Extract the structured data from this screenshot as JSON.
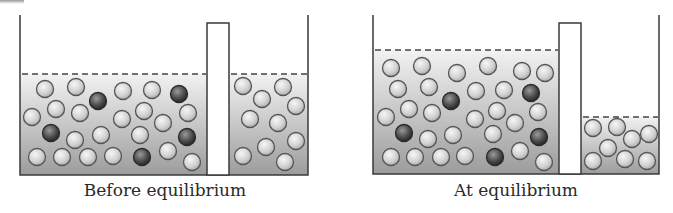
{
  "colors": {
    "outline": "#3a3a3a",
    "fluid_top": "#f2f2f2",
    "fluid_bottom": "#9c9c9c",
    "solvent_ball": "#d6d6d6",
    "solute_ball": "#3c3c3c"
  },
  "panels": [
    {
      "id": "before",
      "caption": "Before equilibrium",
      "caption_x": 165,
      "left_wall_x": 20,
      "right_wall_x": 308,
      "wall_top_y": 15,
      "bottom_y": 175,
      "divider": {
        "x1": 207,
        "x2": 229,
        "top_y": 23
      },
      "left_level_y": 74,
      "right_level_y": 74,
      "balls": [
        {
          "x": 45,
          "y": 89,
          "type": "solvent"
        },
        {
          "x": 76,
          "y": 87,
          "type": "solvent"
        },
        {
          "x": 98,
          "y": 101,
          "type": "solute"
        },
        {
          "x": 123,
          "y": 91,
          "type": "solvent"
        },
        {
          "x": 152,
          "y": 90,
          "type": "solvent"
        },
        {
          "x": 179,
          "y": 94,
          "type": "solute"
        },
        {
          "x": 32,
          "y": 117,
          "type": "solvent"
        },
        {
          "x": 56,
          "y": 109,
          "type": "solvent"
        },
        {
          "x": 80,
          "y": 113,
          "type": "solvent"
        },
        {
          "x": 122,
          "y": 119,
          "type": "solvent"
        },
        {
          "x": 144,
          "y": 111,
          "type": "solvent"
        },
        {
          "x": 163,
          "y": 123,
          "type": "solvent"
        },
        {
          "x": 188,
          "y": 113,
          "type": "solvent"
        },
        {
          "x": 51,
          "y": 133,
          "type": "solute"
        },
        {
          "x": 75,
          "y": 140,
          "type": "solvent"
        },
        {
          "x": 101,
          "y": 135,
          "type": "solvent"
        },
        {
          "x": 140,
          "y": 135,
          "type": "solvent"
        },
        {
          "x": 187,
          "y": 137,
          "type": "solute"
        },
        {
          "x": 37,
          "y": 157,
          "type": "solvent"
        },
        {
          "x": 62,
          "y": 157,
          "type": "solvent"
        },
        {
          "x": 88,
          "y": 157,
          "type": "solvent"
        },
        {
          "x": 113,
          "y": 156,
          "type": "solvent"
        },
        {
          "x": 142,
          "y": 157,
          "type": "solute"
        },
        {
          "x": 168,
          "y": 151,
          "type": "solvent"
        },
        {
          "x": 192,
          "y": 162,
          "type": "solvent"
        },
        {
          "x": 243,
          "y": 86,
          "type": "solvent"
        },
        {
          "x": 283,
          "y": 87,
          "type": "solvent"
        },
        {
          "x": 262,
          "y": 99,
          "type": "solvent"
        },
        {
          "x": 296,
          "y": 106,
          "type": "solvent"
        },
        {
          "x": 250,
          "y": 119,
          "type": "solvent"
        },
        {
          "x": 278,
          "y": 123,
          "type": "solvent"
        },
        {
          "x": 296,
          "y": 141,
          "type": "solvent"
        },
        {
          "x": 266,
          "y": 147,
          "type": "solvent"
        },
        {
          "x": 243,
          "y": 156,
          "type": "solvent"
        },
        {
          "x": 285,
          "y": 162,
          "type": "solvent"
        }
      ]
    },
    {
      "id": "after",
      "caption": "At equilibrium",
      "caption_x": 516,
      "left_wall_x": 373,
      "right_wall_x": 659,
      "wall_top_y": 15,
      "bottom_y": 174,
      "divider": {
        "x1": 559,
        "x2": 581,
        "top_y": 23
      },
      "left_level_y": 50,
      "right_level_y": 117,
      "balls": [
        {
          "x": 391,
          "y": 68,
          "type": "solvent"
        },
        {
          "x": 422,
          "y": 66,
          "type": "solvent"
        },
        {
          "x": 457,
          "y": 73,
          "type": "solvent"
        },
        {
          "x": 488,
          "y": 66,
          "type": "solvent"
        },
        {
          "x": 522,
          "y": 71,
          "type": "solvent"
        },
        {
          "x": 545,
          "y": 73,
          "type": "solvent"
        },
        {
          "x": 398,
          "y": 89,
          "type": "solvent"
        },
        {
          "x": 429,
          "y": 87,
          "type": "solvent"
        },
        {
          "x": 451,
          "y": 101,
          "type": "solute"
        },
        {
          "x": 476,
          "y": 91,
          "type": "solvent"
        },
        {
          "x": 504,
          "y": 90,
          "type": "solvent"
        },
        {
          "x": 531,
          "y": 93,
          "type": "solute"
        },
        {
          "x": 386,
          "y": 117,
          "type": "solvent"
        },
        {
          "x": 409,
          "y": 109,
          "type": "solvent"
        },
        {
          "x": 432,
          "y": 113,
          "type": "solvent"
        },
        {
          "x": 475,
          "y": 119,
          "type": "solvent"
        },
        {
          "x": 497,
          "y": 111,
          "type": "solvent"
        },
        {
          "x": 515,
          "y": 123,
          "type": "solvent"
        },
        {
          "x": 538,
          "y": 112,
          "type": "solvent"
        },
        {
          "x": 404,
          "y": 133,
          "type": "solute"
        },
        {
          "x": 428,
          "y": 139,
          "type": "solvent"
        },
        {
          "x": 453,
          "y": 135,
          "type": "solvent"
        },
        {
          "x": 493,
          "y": 134,
          "type": "solvent"
        },
        {
          "x": 539,
          "y": 137,
          "type": "solute"
        },
        {
          "x": 391,
          "y": 157,
          "type": "solvent"
        },
        {
          "x": 415,
          "y": 157,
          "type": "solvent"
        },
        {
          "x": 441,
          "y": 157,
          "type": "solvent"
        },
        {
          "x": 465,
          "y": 156,
          "type": "solvent"
        },
        {
          "x": 495,
          "y": 157,
          "type": "solute"
        },
        {
          "x": 520,
          "y": 151,
          "type": "solvent"
        },
        {
          "x": 544,
          "y": 162,
          "type": "solvent"
        },
        {
          "x": 593,
          "y": 128,
          "type": "solvent"
        },
        {
          "x": 617,
          "y": 127,
          "type": "solvent"
        },
        {
          "x": 632,
          "y": 139,
          "type": "solvent"
        },
        {
          "x": 649,
          "y": 134,
          "type": "solvent"
        },
        {
          "x": 608,
          "y": 148,
          "type": "solvent"
        },
        {
          "x": 593,
          "y": 161,
          "type": "solvent"
        },
        {
          "x": 625,
          "y": 159,
          "type": "solvent"
        },
        {
          "x": 647,
          "y": 161,
          "type": "solvent"
        }
      ]
    }
  ]
}
